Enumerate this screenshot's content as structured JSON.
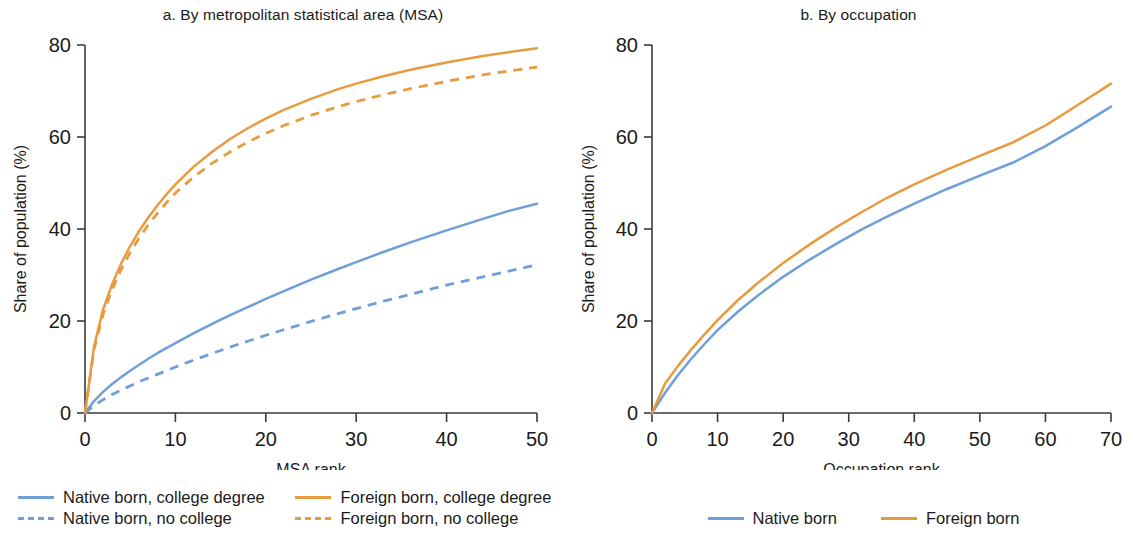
{
  "figure": {
    "background": "#ffffff",
    "colors": {
      "native": "#6f9fd8",
      "foreign": "#e79b3f",
      "axis": "#3a3a3a",
      "text": "#1b1b1b"
    }
  },
  "panel_a": {
    "title": "a. By metropolitan statistical area (MSA)",
    "xlabel": "MSA rank",
    "ylabel": "Share of population (%)",
    "xticks": [
      "0",
      "10",
      "20",
      "30",
      "40",
      "50"
    ],
    "yticks": [
      "0",
      "20",
      "40",
      "60",
      "80"
    ],
    "legend": [
      {
        "label": "Native born, college degree",
        "color": "#6f9fd8",
        "style": "solid"
      },
      {
        "label": "Foreign born, college degree",
        "color": "#e79b3f",
        "style": "solid"
      },
      {
        "label": "Native born, no college",
        "color": "#6f9fd8",
        "style": "dashed"
      },
      {
        "label": "Foreign born, no college",
        "color": "#e79b3f",
        "style": "dashed"
      }
    ]
  },
  "panel_b": {
    "title": "b. By occupation",
    "xlabel": "Occupation rank",
    "ylabel": "Share of population (%)",
    "xticks": [
      "0",
      "10",
      "20",
      "30",
      "40",
      "50",
      "60",
      "70"
    ],
    "yticks": [
      "0",
      "20",
      "40",
      "60",
      "80"
    ],
    "legend": [
      {
        "label": "Native born",
        "color": "#6f9fd8",
        "style": "solid"
      },
      {
        "label": "Foreign born",
        "color": "#e79b3f",
        "style": "solid"
      }
    ]
  },
  "chart_data": [
    {
      "type": "line",
      "panel": "a",
      "title": "a. By metropolitan statistical area (MSA)",
      "xlabel": "MSA rank",
      "ylabel": "Share of population (%)",
      "xlim": [
        0,
        50
      ],
      "ylim": [
        0,
        80
      ],
      "xticks": [
        0,
        10,
        20,
        30,
        40,
        50
      ],
      "yticks": [
        0,
        20,
        40,
        60,
        80
      ],
      "grid": false,
      "legend_position": "below-left",
      "x": [
        0,
        1,
        2,
        3,
        4,
        5,
        6,
        7,
        8,
        9,
        10,
        12,
        14,
        16,
        18,
        20,
        22,
        25,
        28,
        30,
        33,
        36,
        40,
        44,
        47,
        50
      ],
      "series": [
        {
          "name": "Native born, college degree",
          "color": "#6f9fd8",
          "style": "solid",
          "values": [
            0,
            2.6,
            4.6,
            6.3,
            7.8,
            9.2,
            10.5,
            11.8,
            13.0,
            14.1,
            15.2,
            17.3,
            19.3,
            21.2,
            23.0,
            24.8,
            26.5,
            29.0,
            31.3,
            32.8,
            35.0,
            37.1,
            39.7,
            42.2,
            44.0,
            45.5
          ]
        },
        {
          "name": "Native born, no college",
          "color": "#6f9fd8",
          "style": "dashed",
          "values": [
            0,
            1.6,
            2.9,
            4.0,
            5.0,
            5.9,
            6.8,
            7.6,
            8.4,
            9.2,
            10.0,
            11.5,
            12.9,
            14.3,
            15.6,
            16.9,
            18.1,
            19.9,
            21.6,
            22.7,
            24.3,
            25.8,
            27.8,
            29.6,
            30.9,
            32.2
          ]
        },
        {
          "name": "Foreign born, college degree",
          "color": "#e79b3f",
          "style": "solid",
          "values": [
            0,
            14.5,
            22.5,
            28.0,
            32.5,
            36.3,
            39.6,
            42.5,
            45.1,
            47.5,
            49.7,
            53.5,
            56.7,
            59.5,
            61.9,
            64.0,
            65.9,
            68.3,
            70.4,
            71.6,
            73.2,
            74.6,
            76.2,
            77.6,
            78.5,
            79.3
          ]
        },
        {
          "name": "Foreign born, no college",
          "color": "#e79b3f",
          "style": "dashed",
          "values": [
            0,
            13.8,
            21.5,
            26.8,
            31.2,
            34.9,
            38.1,
            40.9,
            43.4,
            45.7,
            47.8,
            51.3,
            54.2,
            56.7,
            58.9,
            60.8,
            62.5,
            64.7,
            66.6,
            67.7,
            69.2,
            70.5,
            72.1,
            73.5,
            74.4,
            75.2
          ]
        }
      ]
    },
    {
      "type": "line",
      "panel": "b",
      "title": "b. By occupation",
      "xlabel": "Occupation rank",
      "ylabel": "Share of population (%)",
      "xlim": [
        0,
        70
      ],
      "ylim": [
        0,
        80
      ],
      "xticks": [
        0,
        10,
        20,
        30,
        40,
        50,
        60,
        70
      ],
      "yticks": [
        0,
        20,
        40,
        60,
        80
      ],
      "grid": false,
      "legend_position": "below-center",
      "x": [
        0,
        2,
        4,
        6,
        8,
        10,
        13,
        16,
        20,
        24,
        28,
        32,
        36,
        40,
        45,
        50,
        55,
        60,
        65,
        70
      ],
      "series": [
        {
          "name": "Native born",
          "color": "#6f9fd8",
          "style": "solid",
          "values": [
            0,
            4.4,
            8.3,
            11.8,
            15.0,
            18.0,
            21.9,
            25.4,
            29.6,
            33.3,
            36.7,
            39.9,
            42.8,
            45.5,
            48.7,
            51.6,
            54.4,
            58.0,
            62.2,
            66.6
          ]
        },
        {
          "name": "Foreign born",
          "color": "#e79b3f",
          "style": "solid",
          "values": [
            0,
            6.4,
            10.3,
            13.8,
            17.1,
            20.2,
            24.4,
            28.1,
            32.6,
            36.6,
            40.3,
            43.7,
            46.9,
            49.7,
            52.9,
            55.9,
            58.8,
            62.5,
            67.0,
            71.6
          ]
        }
      ]
    }
  ]
}
